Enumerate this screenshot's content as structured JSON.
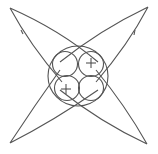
{
  "diagram": {
    "colors": {
      "stroke": "#555555",
      "background": "#ffffff"
    },
    "big_circle": {
      "cx": 78,
      "cy": 76,
      "r": 30
    },
    "small_circles": [
      {
        "id": "top-left",
        "cx": 65,
        "cy": 64,
        "r": 12.5,
        "label": ""
      },
      {
        "id": "top-right",
        "cx": 91,
        "cy": 64,
        "r": 12.5,
        "label": "+"
      },
      {
        "id": "bottom-left",
        "cx": 67,
        "cy": 88,
        "r": 12.5,
        "label": "+"
      },
      {
        "id": "bottom-right",
        "cx": 91,
        "cy": 88,
        "r": 12.5,
        "label": ""
      }
    ],
    "lobes": [
      {
        "id": "top-left",
        "tip": [
          10,
          8
        ]
      },
      {
        "id": "top-right",
        "tip": [
          148,
          7
        ]
      },
      {
        "id": "bottom-left",
        "tip": [
          10,
          143
        ]
      },
      {
        "id": "bottom-right",
        "tip": [
          147,
          144
        ]
      }
    ]
  }
}
